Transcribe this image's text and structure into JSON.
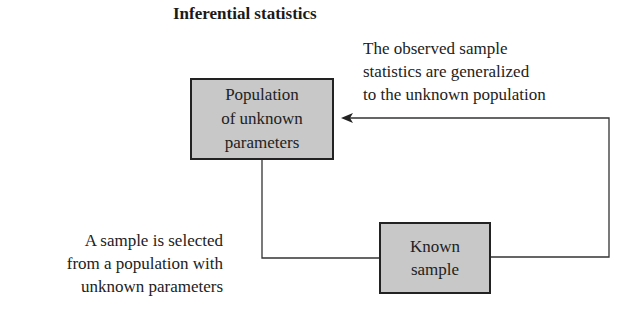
{
  "title": "Inferential statistics",
  "boxes": {
    "population": {
      "lines": [
        "Population",
        "of unknown",
        "parameters"
      ]
    },
    "sample": {
      "lines": [
        "Known",
        "sample"
      ]
    }
  },
  "notes": {
    "generalize": {
      "lines": [
        "The observed sample",
        "statistics are generalized",
        "to the unknown population"
      ]
    },
    "selection": {
      "lines": [
        "A sample is selected",
        "from a population with",
        "unknown parameters"
      ]
    }
  },
  "colors": {
    "box_fill": "#c8c8c8",
    "line": "#222222"
  }
}
